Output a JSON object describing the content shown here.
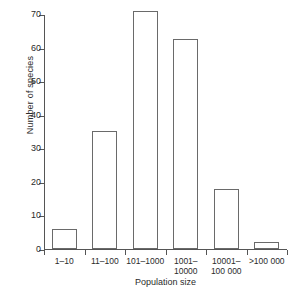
{
  "chart_data": {
    "type": "bar",
    "title": "",
    "subtitle": "",
    "xlabel": "Population size",
    "ylabel": "Number of species",
    "categories": [
      "1–10",
      "11–100",
      "101–1000",
      "1001–\n10000",
      "10001–\n100 000",
      ">100 000"
    ],
    "values": [
      6,
      35,
      71,
      62.5,
      18,
      2
    ],
    "ylim": [
      0,
      70
    ],
    "yticks": [
      0,
      10,
      20,
      30,
      40,
      50,
      60,
      70
    ],
    "ytick_labels": [
      "0",
      "10",
      "20",
      "30",
      "40",
      "50",
      "60",
      "70"
    ],
    "grid": false,
    "legend": null,
    "bar_fill": "#ffffff",
    "bar_edge": "#6a6a6a",
    "axis_color": "#555555",
    "background": "#ffffff"
  }
}
